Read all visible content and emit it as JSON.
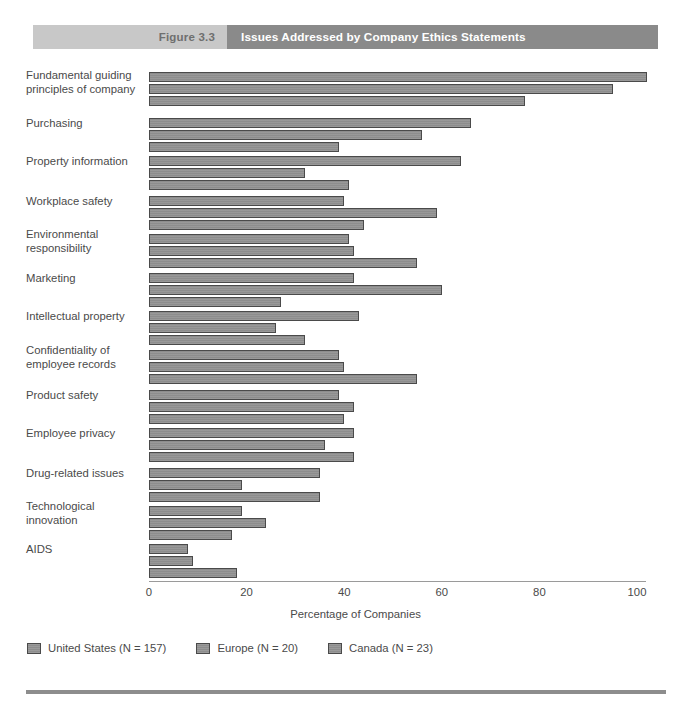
{
  "header": {
    "figure_number": "Figure 3.3",
    "title": "Issues Addressed by Company Ethics Statements",
    "figure_bg": "#c8c8c8",
    "title_bg": "#8a8a8a"
  },
  "chart_data": {
    "type": "bar",
    "orientation": "horizontal",
    "title": "Issues Addressed by Company Ethics Statements",
    "xlabel": "Percentage of Companies",
    "ylabel": "",
    "xlim": [
      0,
      100
    ],
    "xticks": [
      0,
      20,
      40,
      60,
      80,
      100
    ],
    "xtick_labels": [
      "0",
      "20",
      "40",
      "60",
      "80",
      "100"
    ],
    "grid": false,
    "legend_position": "bottom-left",
    "bar_color": "#8d8d8d",
    "bar_border_color": "#4a4a4a",
    "categories": [
      "Fundamental guiding principles of company",
      "Purchasing",
      "Property information",
      "Workplace safety",
      "Environmental responsibility",
      "Marketing",
      "Intellectual property",
      "Confidentiality of employee records",
      "Product safety",
      "Employee privacy",
      "Drug-related issues",
      "Technological innovation",
      "AIDS"
    ],
    "category_lines": [
      [
        "Fundamental guiding",
        "principles of company"
      ],
      [
        "Purchasing"
      ],
      [
        "Property information"
      ],
      [
        "Workplace safety"
      ],
      [
        "Environmental",
        "responsibility"
      ],
      [
        "Marketing"
      ],
      [
        "Intellectual property"
      ],
      [
        "Confidentiality of",
        "employee records"
      ],
      [
        "Product safety"
      ],
      [
        "Employee privacy"
      ],
      [
        "Drug-related issues"
      ],
      [
        "Technological",
        "innovation"
      ],
      [
        "AIDS"
      ]
    ],
    "series": [
      {
        "name": "United States (N = 157)",
        "values": [
          102,
          66,
          64,
          40,
          41,
          42,
          43,
          39,
          39,
          42,
          35,
          19,
          8
        ]
      },
      {
        "name": "Europe (N = 20)",
        "values": [
          95,
          56,
          32,
          59,
          42,
          60,
          26,
          40,
          42,
          36,
          19,
          24,
          9
        ]
      },
      {
        "name": "Canada (N = 23)",
        "values": [
          77,
          39,
          41,
          44,
          55,
          27,
          32,
          55,
          40,
          42,
          35,
          17,
          18
        ]
      }
    ]
  },
  "legend": {
    "items": [
      "United States (N = 157)",
      "Europe (N = 20)",
      "Canada (N = 23)"
    ]
  }
}
